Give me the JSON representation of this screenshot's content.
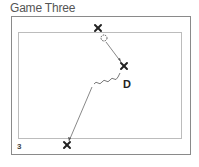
{
  "title": "Game Three",
  "diagram_number": "3",
  "defender_label": "D",
  "colors": {
    "outer_border": "#8a8a8a",
    "inner_border": "#b8b8b8",
    "marker": "#222222",
    "line": "#555555"
  },
  "elements": [
    {
      "type": "player-x",
      "position": "top",
      "x": 98,
      "y": 28
    },
    {
      "type": "ball",
      "x": 104,
      "y": 38
    },
    {
      "type": "player-x",
      "position": "right",
      "x": 124,
      "y": 66
    },
    {
      "type": "defender",
      "label": "D",
      "x": 128,
      "y": 84
    },
    {
      "type": "player-x",
      "position": "bottom",
      "x": 67,
      "y": 145
    }
  ]
}
